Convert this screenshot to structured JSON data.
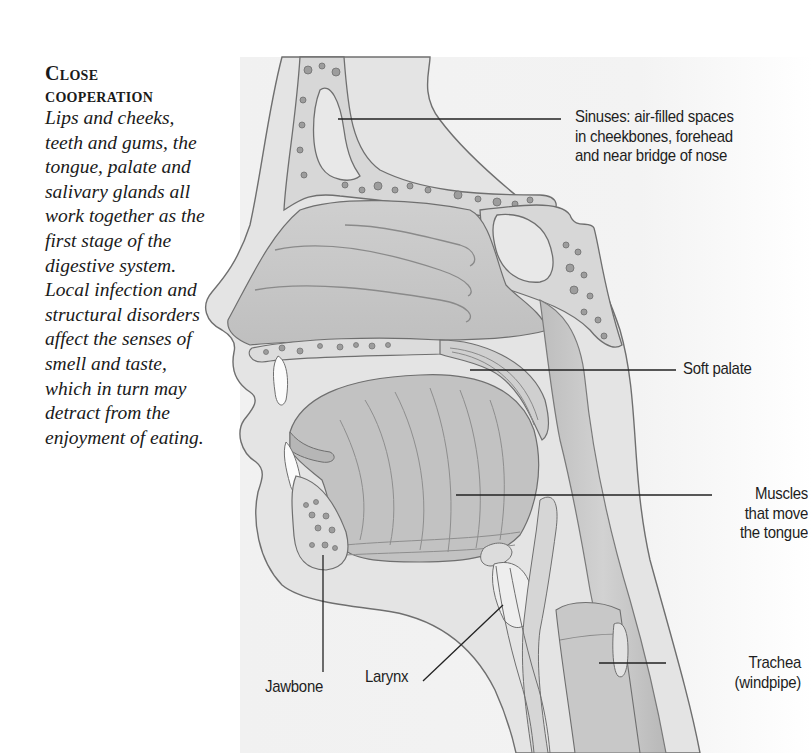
{
  "sidebar": {
    "heading": "Close cooperation",
    "body": "Lips and cheeks, teeth and gums, the tongue, palate and salivary glands all work together as the first stage of the digestive system. Local infection and structural disorders affect the senses of smell and taste, which in turn may detract from the enjoyment of eating."
  },
  "diagram": {
    "colors": {
      "panel_bg": "#f1f1f1",
      "tissue_light": "#e6e6e6",
      "tissue_mid": "#c9c9c9",
      "tissue_dark": "#b3b3b3",
      "bone": "#dcdcdc",
      "outline": "#6f6f6f",
      "leader_line": "#222222",
      "label_text": "#1e1e1e"
    },
    "labels": [
      {
        "id": "sinuses",
        "text": "Sinuses: air-filled spaces\nin cheekbones, forehead\nand near bridge of nose"
      },
      {
        "id": "soft-palate",
        "text": "Soft palate"
      },
      {
        "id": "tongue-muscles",
        "text": "Muscles\nthat move\nthe tongue"
      },
      {
        "id": "jawbone",
        "text": "Jawbone"
      },
      {
        "id": "larynx",
        "text": "Larynx"
      },
      {
        "id": "trachea",
        "text": "Trachea\n(windpipe)"
      }
    ]
  }
}
